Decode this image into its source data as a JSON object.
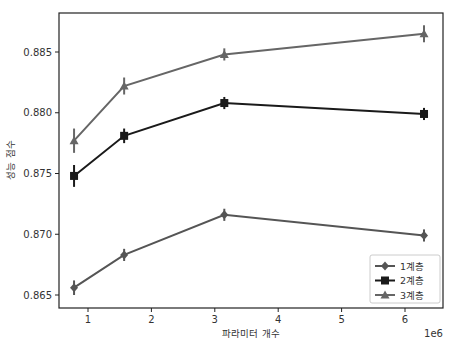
{
  "chart_data": {
    "type": "line",
    "title": "",
    "xlabel": "파라미터 개수",
    "ylabel": "성능 점수",
    "x_offset_label": "1e6",
    "xlim": [
      0.6,
      6.8
    ],
    "ylim": [
      0.8642,
      0.8883
    ],
    "x_ticks": [
      1,
      2,
      3,
      4,
      5,
      6
    ],
    "x_tick_labels": [
      "1",
      "2",
      "3",
      "4",
      "5",
      "6"
    ],
    "y_ticks": [
      0.865,
      0.87,
      0.875,
      0.88,
      0.885
    ],
    "y_tick_labels": [
      "0.865",
      "0.870",
      "0.875",
      "0.880",
      "0.885"
    ],
    "grid": false,
    "legend_position": "lower right",
    "x": [
      0.78,
      1.57,
      3.15,
      6.3
    ],
    "series": [
      {
        "name": "1계층",
        "marker": "diamond",
        "color": "#555555",
        "values": [
          0.8656,
          0.8683,
          0.8716,
          0.8699
        ],
        "err": [
          0.0006,
          0.0005,
          0.0005,
          0.0005
        ]
      },
      {
        "name": "2계층",
        "marker": "square",
        "color": "#1a1a1a",
        "values": [
          0.8748,
          0.8781,
          0.8808,
          0.8799
        ],
        "err": [
          0.0009,
          0.0006,
          0.0005,
          0.0005
        ]
      },
      {
        "name": "3계층",
        "marker": "triangle",
        "color": "#666666",
        "values": [
          0.8777,
          0.8822,
          0.8848,
          0.8865
        ],
        "err": [
          0.001,
          0.0007,
          0.0005,
          0.0007
        ]
      }
    ]
  }
}
